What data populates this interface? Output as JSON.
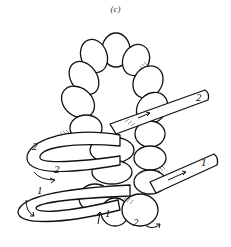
{
  "figure": {
    "caption": "(c)",
    "labels": [
      {
        "id": "end-2-top-right",
        "text": "2"
      },
      {
        "id": "end-1-right",
        "text": "1"
      },
      {
        "id": "loop-2-left-upper",
        "text": "2"
      },
      {
        "id": "loop-2-left-inner",
        "text": "2"
      },
      {
        "id": "loop-1-left-lower",
        "text": "1"
      },
      {
        "id": "bottom-1",
        "text": "1"
      },
      {
        "id": "bottom-2",
        "text": "2"
      }
    ]
  }
}
